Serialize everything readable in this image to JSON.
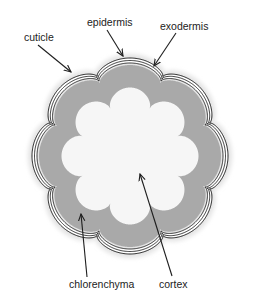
{
  "diagram": {
    "center": [
      130,
      156
    ],
    "lobes": 8,
    "colors": {
      "background": "#ffffff",
      "halo": "#e4e4e4",
      "chlorenchyma": "#a9a9a9",
      "cortex": "#f6f6f6",
      "outline": "#1e1e1e",
      "arrow": "#1e1e1e",
      "text": "#222222"
    },
    "layers": {
      "halo": {
        "base": 96,
        "amp": 12
      },
      "cuticle": {
        "base": 92,
        "amp": 12
      },
      "epidermis": {
        "base": 89.5,
        "amp": 12
      },
      "exodermis": {
        "base": 87,
        "amp": 12
      },
      "chlorenchyma": {
        "base": 85,
        "amp": 12
      },
      "cortex": {
        "base": 60,
        "amp": 17
      }
    },
    "labels": [
      {
        "id": "cuticle",
        "text": "cuticle",
        "x": 24,
        "y": 41,
        "arrow": [
          38,
          45,
          71,
          72
        ]
      },
      {
        "id": "epidermis",
        "text": "epidermis",
        "x": 87,
        "y": 26,
        "arrow": [
          107,
          30,
          123,
          56
        ]
      },
      {
        "id": "exodermis",
        "text": "exodermis",
        "x": 160,
        "y": 30,
        "arrow": [
          176,
          33,
          154,
          66
        ]
      },
      {
        "id": "chlorenchyma",
        "text": "chlorenchyma",
        "x": 69,
        "y": 288,
        "arrow": [
          87,
          277,
          81,
          214
        ]
      },
      {
        "id": "cortex",
        "text": "cortex",
        "x": 159,
        "y": 288,
        "arrow": [
          172,
          276,
          140,
          174
        ]
      }
    ]
  }
}
